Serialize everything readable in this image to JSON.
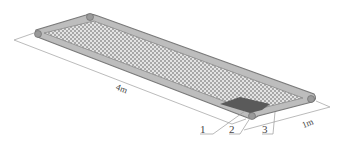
{
  "diagram": {
    "dimensions": {
      "length": {
        "label": "4m"
      },
      "width": {
        "label": "1m"
      }
    },
    "callouts": [
      {
        "id": "1",
        "label": "1"
      },
      {
        "id": "2",
        "label": "2"
      },
      {
        "id": "3",
        "label": "3"
      }
    ],
    "colors": {
      "frame": "#8a8a8a",
      "mesh": "#c8c8c8",
      "peeled_corner": "#555555",
      "dimension_line": "#aaaaaa"
    }
  }
}
